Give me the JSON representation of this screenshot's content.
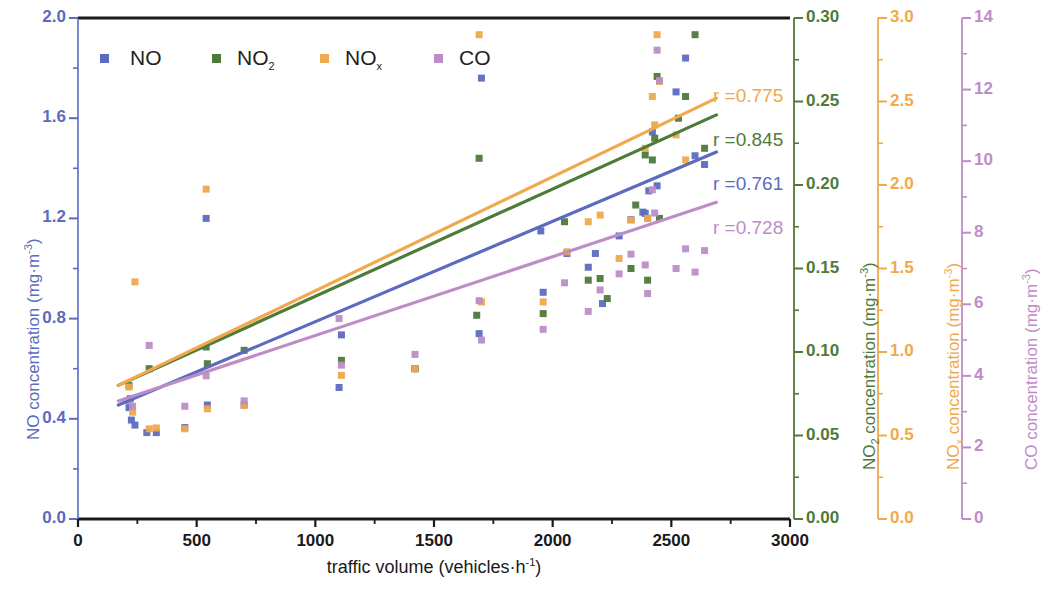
{
  "chart_data": {
    "type": "scatter",
    "title": "",
    "xlabel": "traffic volume (vehicles·h⁻¹)",
    "xlabel_main": "traffic volume (vehicles·h",
    "xlabel_sup": "-1",
    "xlabel_tail": ")",
    "xlim": [
      0,
      3000
    ],
    "xticks": [
      0,
      500,
      1000,
      1500,
      2000,
      2500,
      3000
    ],
    "xticklabels": [
      "0",
      "500",
      "1000",
      "1500",
      "2000",
      "2500",
      "3000"
    ],
    "grid": false,
    "legend_position": "top-left-inside",
    "axes": [
      {
        "key": "NO",
        "label_main": "NO concentration (mg·m",
        "label_sup": "-3",
        "label_tail": ")",
        "color": "#5C6BC0",
        "side": "left",
        "lim": [
          0.0,
          2.0
        ],
        "ticks": [
          0.0,
          0.4,
          0.8,
          1.2,
          1.6,
          2.0
        ],
        "ticklabels": [
          "0.0",
          "0.4",
          "0.8",
          "1.2",
          "1.6",
          "2.0"
        ],
        "minor_per_major": 2
      },
      {
        "key": "NO2",
        "label_main": "NO",
        "label_sub": "2",
        "label_mid": " concentration (mg·m",
        "label_sup": "-3",
        "label_tail": ")",
        "color": "#4E7A3A",
        "side": "right",
        "lim": [
          0.0,
          0.3
        ],
        "ticks": [
          0.0,
          0.05,
          0.1,
          0.15,
          0.2,
          0.25,
          0.3
        ],
        "ticklabels": [
          "0.00",
          "0.05",
          "0.10",
          "0.15",
          "0.20",
          "0.25",
          "0.30"
        ],
        "minor_per_major": 2
      },
      {
        "key": "NOx",
        "label_main": "NO",
        "label_sub": "x",
        "label_mid": " concentration (mg·m",
        "label_sup": "-3",
        "label_tail": ")",
        "color": "#F0A94C",
        "side": "right",
        "lim": [
          0.0,
          3.0
        ],
        "ticks": [
          0.0,
          0.5,
          1.0,
          1.5,
          2.0,
          2.5,
          3.0
        ],
        "ticklabels": [
          "0.0",
          "0.5",
          "1.0",
          "1.5",
          "2.0",
          "2.5",
          "3.0"
        ],
        "minor_per_major": 2
      },
      {
        "key": "CO",
        "label_main": "CO concentration (mg·m",
        "label_sup": "-3",
        "label_tail": ")",
        "color": "#BE8DC8",
        "side": "right",
        "lim": [
          0,
          14
        ],
        "ticks": [
          0,
          2,
          4,
          6,
          8,
          10,
          12,
          14
        ],
        "ticklabels": [
          "0",
          "2",
          "4",
          "6",
          "8",
          "10",
          "12",
          "14"
        ],
        "minor_per_major": 2
      }
    ],
    "legend": [
      {
        "label": "NO",
        "color": "#5C6BC0"
      },
      {
        "label": "NO",
        "sub": "2",
        "color": "#4E7A3A"
      },
      {
        "label": "NO",
        "sub": "x",
        "color": "#F0A94C"
      },
      {
        "label": "CO",
        "color": "#BE8DC8"
      }
    ],
    "annotations": [
      {
        "text": "r =0.775",
        "color": "#F0A94C",
        "series": "NOx"
      },
      {
        "text": "r =0.845",
        "color": "#4E7A3A",
        "series": "NO2"
      },
      {
        "text": "r =0.761",
        "color": "#5C6BC0",
        "series": "NO"
      },
      {
        "text": "r =0.728",
        "color": "#BE8DC8",
        "series": "CO"
      }
    ],
    "series": [
      {
        "name": "NO",
        "color": "#5C6BC0",
        "axis": "NO",
        "r": 0.761,
        "fit": {
          "x0": 170,
          "y0": 0.455,
          "x1": 2690,
          "y1": 1.465
        },
        "points": [
          [
            215,
            0.445
          ],
          [
            225,
            0.395
          ],
          [
            240,
            0.375
          ],
          [
            290,
            0.345
          ],
          [
            330,
            0.345
          ],
          [
            450,
            0.365
          ],
          [
            540,
            1.2
          ],
          [
            545,
            0.455
          ],
          [
            700,
            0.455
          ],
          [
            1100,
            0.525
          ],
          [
            1110,
            0.735
          ],
          [
            1420,
            0.6
          ],
          [
            1690,
            0.74
          ],
          [
            1700,
            1.76
          ],
          [
            1950,
            1.15
          ],
          [
            1960,
            0.905
          ],
          [
            2060,
            1.06
          ],
          [
            2150,
            1.005
          ],
          [
            2180,
            1.06
          ],
          [
            2210,
            0.86
          ],
          [
            2280,
            1.13
          ],
          [
            2330,
            1.195
          ],
          [
            2380,
            1.225
          ],
          [
            2390,
            1.22
          ],
          [
            2400,
            1.2
          ],
          [
            2405,
            1.31
          ],
          [
            2420,
            1.545
          ],
          [
            2440,
            1.33
          ],
          [
            2520,
            1.705
          ],
          [
            2560,
            1.84
          ],
          [
            2600,
            1.45
          ],
          [
            2640,
            1.415
          ]
        ]
      },
      {
        "name": "NO2",
        "color": "#4E7A3A",
        "axis": "NO2",
        "r": 0.845,
        "fit": {
          "x0": 170,
          "y0": 0.08,
          "x1": 2690,
          "y1": 0.242
        },
        "points": [
          [
            215,
            0.08
          ],
          [
            220,
            0.072
          ],
          [
            300,
            0.09
          ],
          [
            540,
            0.103
          ],
          [
            545,
            0.093
          ],
          [
            700,
            0.101
          ],
          [
            1110,
            0.095
          ],
          [
            1420,
            0.09
          ],
          [
            1680,
            0.122
          ],
          [
            1690,
            0.216
          ],
          [
            1960,
            0.123
          ],
          [
            2050,
            0.178
          ],
          [
            2150,
            0.143
          ],
          [
            2200,
            0.144
          ],
          [
            2230,
            0.132
          ],
          [
            2330,
            0.15
          ],
          [
            2350,
            0.188
          ],
          [
            2390,
            0.218
          ],
          [
            2400,
            0.143
          ],
          [
            2420,
            0.215
          ],
          [
            2430,
            0.228
          ],
          [
            2440,
            0.265
          ],
          [
            2450,
            0.18
          ],
          [
            2530,
            0.24
          ],
          [
            2560,
            0.253
          ],
          [
            2600,
            0.29
          ],
          [
            2640,
            0.222
          ]
        ]
      },
      {
        "name": "NOx",
        "color": "#F0A94C",
        "axis": "NOx",
        "r": 0.775,
        "fit": {
          "x0": 170,
          "y0": 0.8,
          "x1": 2690,
          "y1": 2.52
        },
        "points": [
          [
            215,
            0.79
          ],
          [
            230,
            0.64
          ],
          [
            240,
            1.42
          ],
          [
            300,
            0.54
          ],
          [
            330,
            0.545
          ],
          [
            450,
            0.54
          ],
          [
            540,
            1.975
          ],
          [
            545,
            0.66
          ],
          [
            700,
            0.68
          ],
          [
            1110,
            0.86
          ],
          [
            1420,
            0.9
          ],
          [
            1690,
            2.9
          ],
          [
            1700,
            1.3
          ],
          [
            1960,
            1.3
          ],
          [
            2060,
            1.6
          ],
          [
            2150,
            1.78
          ],
          [
            2200,
            1.82
          ],
          [
            2280,
            1.56
          ],
          [
            2330,
            1.79
          ],
          [
            2390,
            2.22
          ],
          [
            2400,
            1.8
          ],
          [
            2420,
            2.53
          ],
          [
            2430,
            2.36
          ],
          [
            2440,
            2.9
          ],
          [
            2450,
            2.62
          ],
          [
            2520,
            2.3
          ],
          [
            2560,
            2.15
          ]
        ]
      },
      {
        "name": "CO",
        "color": "#BE8DC8",
        "axis": "CO",
        "r": 0.728,
        "fit": {
          "x0": 170,
          "y0": 3.3,
          "x1": 2690,
          "y1": 8.85
        },
        "points": [
          [
            215,
            3.3
          ],
          [
            230,
            3.15
          ],
          [
            300,
            4.85
          ],
          [
            450,
            3.15
          ],
          [
            540,
            4.0
          ],
          [
            700,
            3.3
          ],
          [
            1100,
            5.6
          ],
          [
            1110,
            4.3
          ],
          [
            1420,
            4.6
          ],
          [
            1690,
            6.1
          ],
          [
            1700,
            5.0
          ],
          [
            1960,
            5.3
          ],
          [
            2050,
            6.6
          ],
          [
            2150,
            5.8
          ],
          [
            2200,
            6.4
          ],
          [
            2280,
            6.85
          ],
          [
            2330,
            7.4
          ],
          [
            2390,
            7.1
          ],
          [
            2400,
            6.3
          ],
          [
            2420,
            9.2
          ],
          [
            2430,
            8.55
          ],
          [
            2440,
            13.1
          ],
          [
            2450,
            12.25
          ],
          [
            2520,
            7.0
          ],
          [
            2560,
            7.55
          ],
          [
            2600,
            6.9
          ],
          [
            2640,
            7.5
          ]
        ]
      }
    ]
  }
}
